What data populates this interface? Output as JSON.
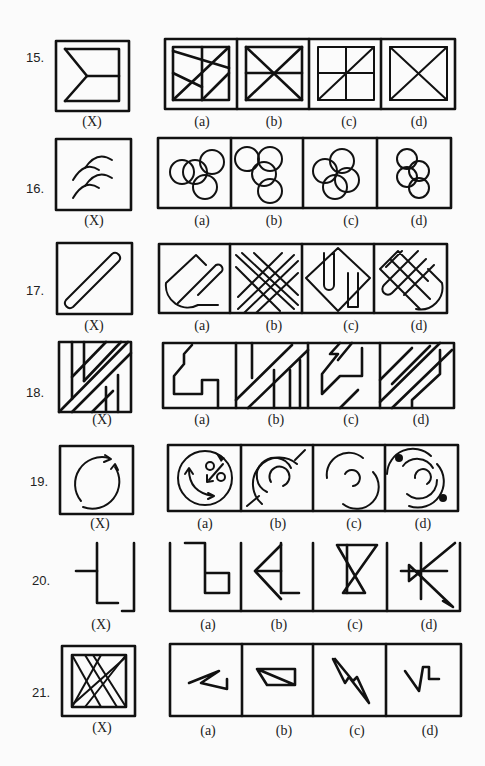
{
  "page": {
    "questions": [
      {
        "number": "15.",
        "figure_label": "(X)",
        "options": [
          "(a)",
          "(b)",
          "(c)",
          "(d)"
        ]
      },
      {
        "number": "16.",
        "figure_label": "(X)",
        "options": [
          "(a)",
          "(b)",
          "(c)",
          "(d)"
        ]
      },
      {
        "number": "17.",
        "figure_label": "(X)",
        "options": [
          "(a)",
          "(b)",
          "(c)",
          "(d)"
        ]
      },
      {
        "number": "18.",
        "figure_label": "(X)",
        "options": [
          "(a)",
          "(b)",
          "(c)",
          "(d)"
        ]
      },
      {
        "number": "19.",
        "figure_label": "(X)",
        "options": [
          "(a)",
          "(b)",
          "(c)",
          "(d)"
        ]
      },
      {
        "number": "20.",
        "figure_label": "(X)",
        "options": [
          "(a)",
          "(b)",
          "(c)",
          "(d)"
        ]
      },
      {
        "number": "21.",
        "figure_label": "(X)",
        "options": [
          "(a)",
          "(b)",
          "(c)",
          "(d)"
        ]
      }
    ]
  }
}
